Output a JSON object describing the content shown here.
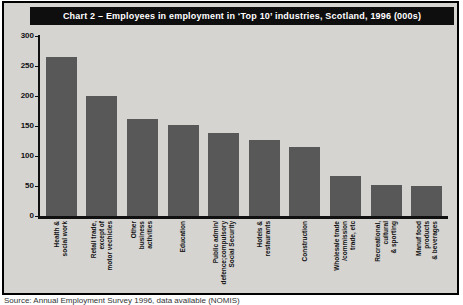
{
  "title": "Chart 2 – Employees in employment in ‘Top 10’ industries, Scotland, 1996 (000s)",
  "caption": "Source: Annual Employment Survey 1996, data available (NOMIS)",
  "colors": {
    "bar": "#585858",
    "panel_bg": "#d5d4d1",
    "title_bg": "#0e0e0e",
    "title_text": "#ffffff",
    "axis": "#111111"
  },
  "chart_data": {
    "type": "bar",
    "title": "Chart 2 – Employees in employment in ‘Top 10’ industries, Scotland, 1996 (000s)",
    "categories": [
      "Health &\nsocial work",
      "Retail trade,\nexcept of\nmotor vechicles",
      "Other\nbusiness\nactivities",
      "Education",
      "Public admin/\ndefence;compulsory\nSocial Security",
      "Hotels &\nrestaurants",
      "Construction",
      "Wholesale trade\n/commission\ntrade, etc",
      "Recreational,\ncultural\n& sporting",
      "Manuf food\nproducts\n& beverages"
    ],
    "values": [
      265,
      200,
      162,
      152,
      139,
      126,
      115,
      67,
      52,
      50
    ],
    "xlabel": "",
    "ylabel": "",
    "ylim": [
      0,
      300
    ],
    "yticks": [
      0,
      50,
      100,
      150,
      200,
      250,
      300
    ],
    "grid": false,
    "legend": null,
    "bar_color": "#585858"
  }
}
